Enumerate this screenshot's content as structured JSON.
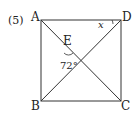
{
  "problem_number": "(5)",
  "points": {
    "A": "A",
    "B": "B",
    "C": "C",
    "D": "D",
    "E": "E"
  },
  "angle_label": "72°",
  "unknown_label": "x",
  "colors": {
    "stroke": "#333333",
    "text": "#222222"
  }
}
